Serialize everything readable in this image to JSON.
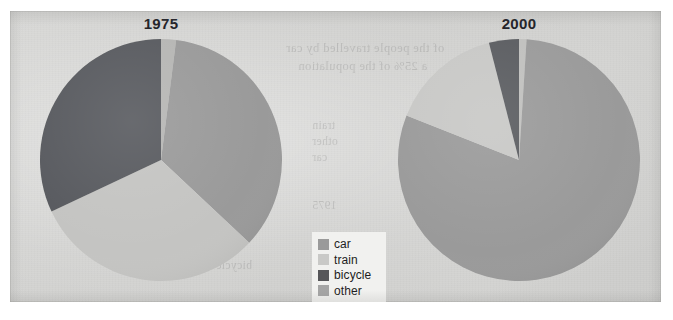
{
  "panel": {
    "bleed_text": [
      "of the people travelled by car",
      "a 25% of the population",
      "train",
      "other",
      "car",
      "1975",
      "bicycle"
    ]
  },
  "legend": {
    "items": [
      {
        "label": "car",
        "color": "#9a9a9a",
        "icon": "color-swatch-icon"
      },
      {
        "label": "train",
        "color": "#c9c9c7",
        "icon": "color-swatch-icon"
      },
      {
        "label": "bicycle",
        "color": "#565659",
        "icon": "color-swatch-icon"
      },
      {
        "label": "other",
        "color": "#a5a5a5",
        "icon": "color-swatch-icon"
      }
    ]
  },
  "chart_data": [
    {
      "type": "pie",
      "title": "1975",
      "categories": [
        "other",
        "car",
        "train",
        "bicycle"
      ],
      "values": [
        2,
        35,
        31,
        32
      ],
      "colors": [
        "#b6b6b4",
        "#9a9a9a",
        "#c4c4c2",
        "#585a5e"
      ],
      "start_angle": 0,
      "direction": "clockwise",
      "legend_position": "center",
      "grid": false,
      "xlabel": "",
      "ylabel": ""
    },
    {
      "type": "pie",
      "title": "2000",
      "categories": [
        "other",
        "car",
        "train",
        "bicycle"
      ],
      "values": [
        1,
        80,
        15,
        4
      ],
      "colors": [
        "#c0c0be",
        "#9a9a9a",
        "#c8c8c6",
        "#5a5c60"
      ],
      "start_angle": 0,
      "direction": "clockwise",
      "legend_position": "center",
      "grid": false,
      "xlabel": "",
      "ylabel": ""
    }
  ]
}
